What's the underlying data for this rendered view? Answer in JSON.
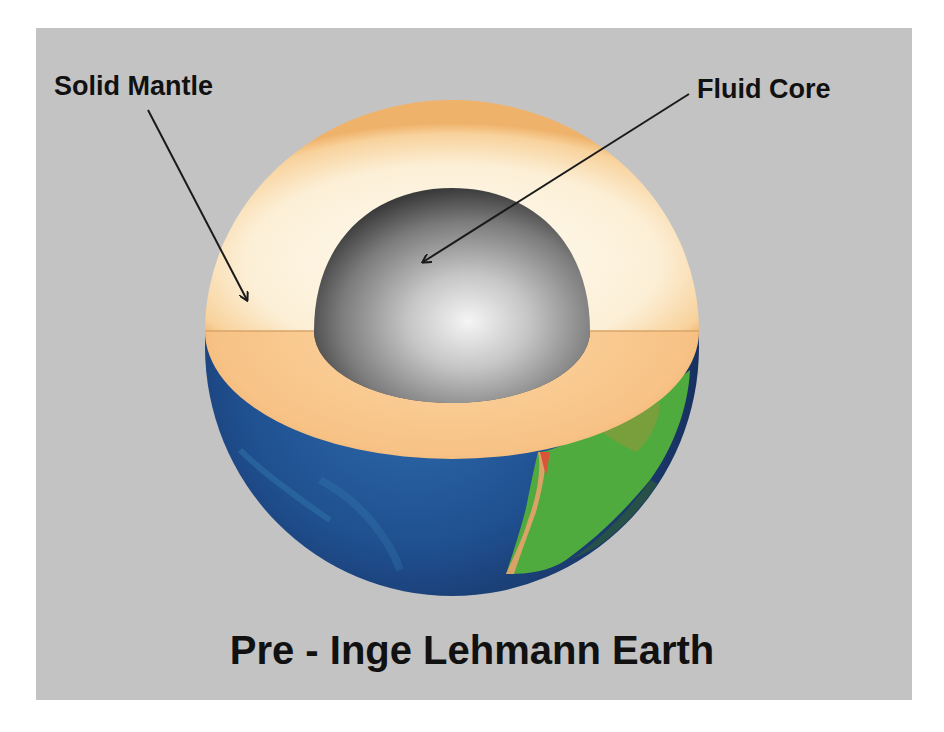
{
  "diagram": {
    "title": "Pre - Inge Lehmann Earth",
    "labels": {
      "mantle": "Solid Mantle",
      "core": "Fluid Core"
    },
    "layers": [
      {
        "name": "Solid Mantle",
        "color": "#fbe6c2"
      },
      {
        "name": "Fluid Core",
        "color": "#9a9a9a"
      }
    ],
    "colors": {
      "background": "#c3c3c3",
      "mantle_light": "#fdf3df",
      "mantle_cut": "#f6bf7c",
      "core_highlight": "#f2f2f2",
      "core_shadow": "#3e3e3e",
      "ocean": "#1e4f8e",
      "ocean_dark": "#13244f",
      "land": "#56b33f",
      "arrow": "#1a1a1a"
    }
  }
}
